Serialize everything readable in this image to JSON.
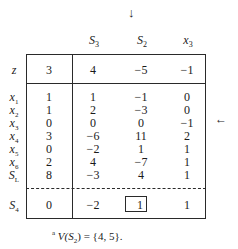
{
  "table": {
    "entering_marker": "↓",
    "leaving_marker": "←",
    "columns": [
      {
        "name": "S",
        "sub": "3"
      },
      {
        "name": "S",
        "sub": "2"
      },
      {
        "name": "x",
        "sub": "3"
      }
    ],
    "objective_row": {
      "label": "z",
      "rhs": "3",
      "values": [
        "4",
        "−5",
        "−1"
      ]
    },
    "rows": [
      {
        "label": "x",
        "sub": "1",
        "rhs": "1",
        "values": [
          "1",
          "−1",
          "0"
        ]
      },
      {
        "label": "x",
        "sub": "2",
        "rhs": "1",
        "values": [
          "2",
          "−3",
          "0"
        ]
      },
      {
        "label": "x",
        "sub": "3",
        "rhs": "0",
        "values": [
          "0",
          "0",
          "−1"
        ]
      },
      {
        "label": "x",
        "sub": "4",
        "rhs": "3",
        "values": [
          "−6",
          "11",
          "2"
        ]
      },
      {
        "label": "x",
        "sub": "5",
        "rhs": "0",
        "values": [
          "−2",
          "1",
          "1"
        ]
      },
      {
        "label": "x",
        "sub": "6",
        "rhs": "2",
        "values": [
          "4",
          "−7",
          "1"
        ]
      },
      {
        "label": "S",
        "sub": "L",
        "rhs": "8",
        "values": [
          "−3",
          "4",
          "1"
        ]
      }
    ],
    "cut_row": {
      "label": "S",
      "sub": "4",
      "rhs": "0",
      "values": [
        "−2",
        "1",
        "1"
      ],
      "pivot_column": 1
    }
  },
  "footnote": {
    "marker": "a",
    "text": "V(S",
    "sub": "2",
    "rest": ") = {4, 5}."
  }
}
